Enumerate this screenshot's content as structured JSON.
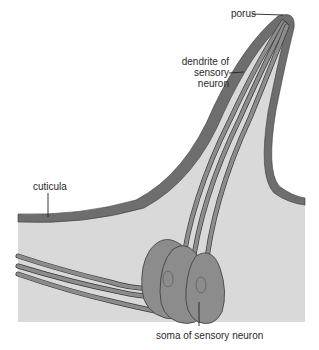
{
  "figure": {
    "type": "anatomical diagram",
    "colors": {
      "background": "#ffffff",
      "cuticle": "#6e6e6e",
      "hemolymph_fill": "#d9d9d9",
      "neuron_fill": "#8c8c8c",
      "outline": "#3a3a3a"
    }
  },
  "labels": {
    "porus": "porus",
    "dendrite_line1": "dendrite of",
    "dendrite_line2": "sensory",
    "dendrite_line3": "neuron",
    "cuticula": "cuticula",
    "soma": "soma of sensory neuron"
  }
}
